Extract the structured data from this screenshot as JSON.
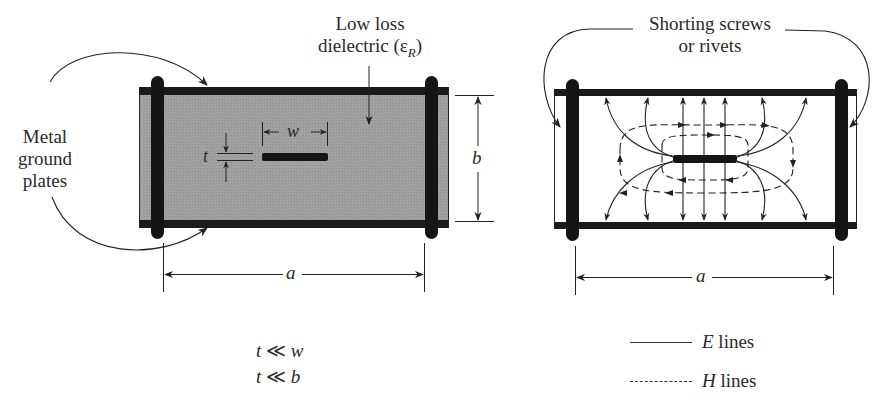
{
  "figure": {
    "left_panel": {
      "title": "Stripline cross-section",
      "labels": {
        "ground_plates": [
          "Metal",
          "ground",
          "plates"
        ],
        "dielectric_line1": "Low loss",
        "dielectric_line2": "dielectric (",
        "dielectric_symbol": "ε",
        "dielectric_sub": "R",
        "dielectric_close": ")",
        "dim_w": "w",
        "dim_t": "t",
        "dim_b": "b",
        "dim_a": "a"
      },
      "fill_color": "#9a9a9a",
      "metal_color": "#1a1a1a"
    },
    "right_panel": {
      "title": "Field lines",
      "labels": {
        "screws_line1": "Shorting screws",
        "screws_line2": "or rivets",
        "dim_a": "a"
      }
    },
    "conditions": [
      {
        "lhs": "t",
        "op": "≪",
        "rhs": "w"
      },
      {
        "lhs": "t",
        "op": "≪",
        "rhs": "b"
      }
    ],
    "legend": [
      {
        "style": "solid",
        "symbol": "E",
        "text": "lines"
      },
      {
        "style": "dashed",
        "symbol": "H",
        "text": "lines"
      }
    ]
  }
}
